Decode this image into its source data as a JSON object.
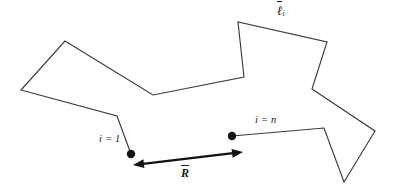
{
  "figure": {
    "background_color": "#ffffff",
    "line_color": "#3a3a3a",
    "dot_color": "#151515",
    "arrow_color": "#111111",
    "width": 396,
    "height": 192
  },
  "labels": {
    "segment_vector": {
      "symbol": "ℓ",
      "subscript": "i",
      "name": "bond-vector-label"
    },
    "start_index": {
      "text": "i = 1",
      "name": "start-index-label"
    },
    "end_index": {
      "text": "i = n",
      "name": "end-index-label"
    },
    "end_to_end_vector": {
      "symbol": "R",
      "name": "end-to-end-vector-label"
    }
  },
  "chain": {
    "description": "Open polyline of straight bond segments forming a random-walk chain",
    "vertices": [
      [
        131,
        154
      ],
      [
        117,
        116
      ],
      [
        21,
        90
      ],
      [
        65,
        41
      ],
      [
        153,
        95
      ],
      [
        244,
        77
      ],
      [
        238,
        22
      ],
      [
        327,
        42
      ],
      [
        312,
        89
      ],
      [
        375,
        131
      ],
      [
        344,
        182
      ],
      [
        324,
        128
      ],
      [
        232,
        136
      ]
    ]
  },
  "endpoints": [
    {
      "name": "chain-start-dot",
      "x": 131,
      "y": 154,
      "r": 4.2
    },
    {
      "name": "chain-end-dot",
      "x": 232,
      "y": 136,
      "r": 4.2
    }
  ],
  "end_to_end_arrow": {
    "name": "end-to-end-arrow",
    "from": [
      133,
      165
    ],
    "to": [
      243,
      152
    ],
    "double_headed": true
  }
}
